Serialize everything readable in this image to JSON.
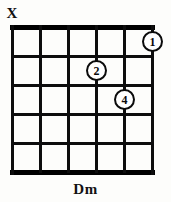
{
  "diagram": {
    "type": "guitar-chord-diagram",
    "chord_name": "Dm",
    "string_count": 6,
    "fret_count": 5,
    "starting_fret": 1,
    "ink_color": "#0d0d0d",
    "background_color": "#fdfdfb",
    "geometry": {
      "string_x": [
        12,
        40,
        68,
        96,
        124,
        152
      ],
      "fret_y": [
        27,
        56,
        85,
        114,
        143,
        172
      ]
    },
    "open_muted_markers": [
      {
        "id": "marker-string-6",
        "symbol": "X",
        "string_index": 0,
        "meaning": "muted"
      }
    ],
    "finger_positions": [
      {
        "id": "finger-1",
        "finger": "1",
        "string_index": 5,
        "fret": 1
      },
      {
        "id": "finger-2",
        "finger": "2",
        "string_index": 3,
        "fret": 2
      },
      {
        "id": "finger-4",
        "finger": "4",
        "string_index": 4,
        "fret": 3
      }
    ]
  }
}
